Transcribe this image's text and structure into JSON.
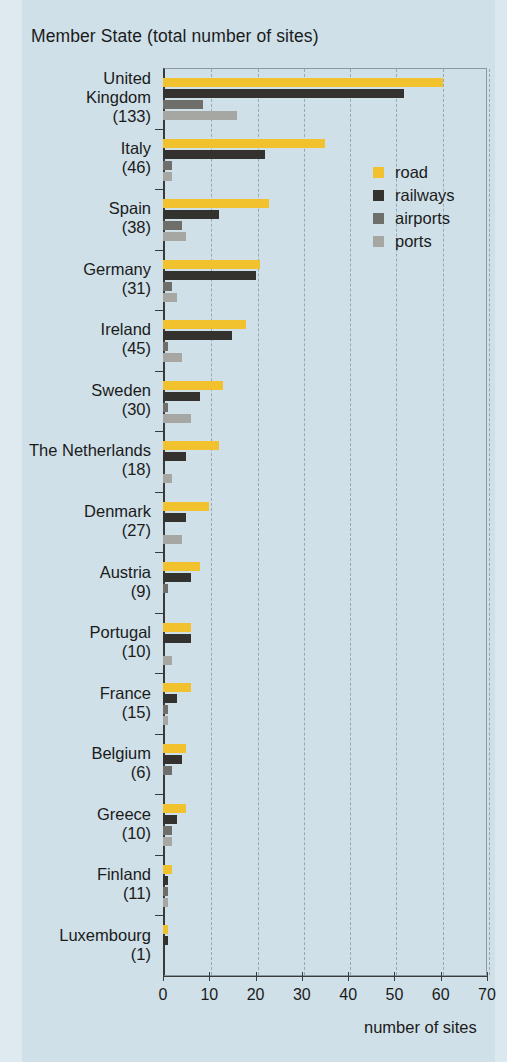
{
  "chart_title": "Member State (total number of sites)",
  "axis": {
    "x_label": "number of sites",
    "ticks": [
      "0",
      "10",
      "20",
      "30",
      "40",
      "50",
      "60",
      "70"
    ]
  },
  "legend": {
    "items": [
      {
        "label": "road",
        "color": "#f2c12e"
      },
      {
        "label": "railways",
        "color": "#33322f"
      },
      {
        "label": "airports",
        "color": "#6e6e6a"
      },
      {
        "label": "ports",
        "color": "#a6a6a2"
      }
    ]
  },
  "chart_data": {
    "type": "bar",
    "orientation": "horizontal",
    "title": "Member State (total number of sites)",
    "xlabel": "number of sites",
    "ylabel": "",
    "xlim": [
      0,
      70
    ],
    "xticks": [
      0,
      10,
      20,
      30,
      40,
      50,
      60,
      70
    ],
    "grid": "vertical dashed gridlines at each 10 units",
    "legend_position": "inside upper right",
    "categories": [
      "United Kingdom",
      "Italy",
      "Spain",
      "Germany",
      "Ireland",
      "Sweden",
      "The Netherlands",
      "Denmark",
      "Austria",
      "Portugal",
      "France",
      "Belgium",
      "Greece",
      "Finland",
      "Luxembourg"
    ],
    "category_labels": [
      {
        "name": "United",
        "name2": "Kingdom",
        "count": "(133)",
        "total": 133
      },
      {
        "name": "Italy",
        "count": "(46)",
        "total": 46
      },
      {
        "name": "Spain",
        "count": "(38)",
        "total": 38
      },
      {
        "name": "Germany",
        "count": "(31)",
        "total": 31
      },
      {
        "name": "Ireland",
        "count": "(45)",
        "total": 45
      },
      {
        "name": "Sweden",
        "count": "(30)",
        "total": 30
      },
      {
        "name": "The Netherlands",
        "count": "(18)",
        "total": 18
      },
      {
        "name": "Denmark",
        "count": "(27)",
        "total": 27
      },
      {
        "name": "Austria",
        "count": "(9)",
        "total": 9
      },
      {
        "name": "Portugal",
        "count": "(10)",
        "total": 10
      },
      {
        "name": "France",
        "count": "(15)",
        "total": 15
      },
      {
        "name": "Belgium",
        "count": "(6)",
        "total": 6
      },
      {
        "name": "Greece",
        "count": "(10)",
        "total": 10
      },
      {
        "name": "Finland",
        "count": "(11)",
        "total": 11
      },
      {
        "name": "Luxembourg",
        "count": "(1)",
        "total": 1
      }
    ],
    "series": [
      {
        "name": "road",
        "color": "#f2c12e",
        "values": [
          60.5,
          35,
          23,
          21,
          18,
          13,
          12,
          10,
          8,
          6,
          6,
          5,
          5,
          2,
          1
        ]
      },
      {
        "name": "railways",
        "color": "#33322f",
        "values": [
          52,
          22,
          12,
          20,
          15,
          8,
          5,
          5,
          6,
          6,
          3,
          4,
          3,
          1,
          1
        ]
      },
      {
        "name": "airports",
        "color": "#6e6e6a",
        "values": [
          8.6,
          2,
          4,
          2,
          1,
          1,
          0,
          0,
          1,
          0,
          1,
          2,
          2,
          1,
          0
        ]
      },
      {
        "name": "ports",
        "color": "#a6a6a2",
        "values": [
          16,
          2,
          5,
          3,
          4,
          6,
          2,
          4,
          0,
          2,
          1,
          0,
          2,
          1,
          0
        ]
      }
    ]
  }
}
